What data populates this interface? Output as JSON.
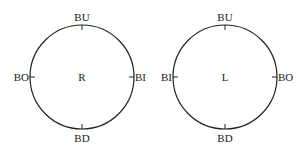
{
  "diagrams": [
    {
      "name": "right-eye",
      "center_label": "R",
      "top_label": "BU",
      "bottom_label": "BD",
      "left_label": "BO",
      "right_label": "BI"
    },
    {
      "name": "left-eye",
      "center_label": "L",
      "top_label": "BU",
      "bottom_label": "BD",
      "left_label": "BI",
      "right_label": "BO"
    }
  ],
  "colors": {
    "stroke": "#222222",
    "background": "#ffffff"
  }
}
